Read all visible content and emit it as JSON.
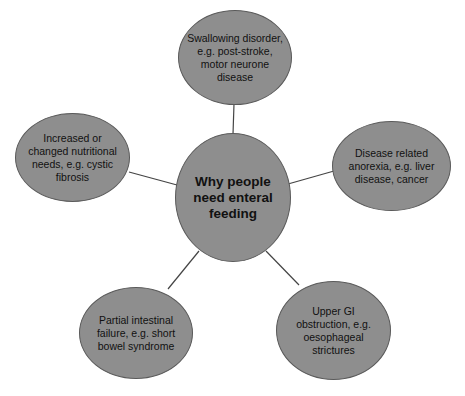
{
  "diagram": {
    "type": "spider/mind-map",
    "colors": {
      "node_fill": "#8e8e8e",
      "node_border": "#5a5a5a",
      "link": "#444444",
      "text": "#111111",
      "background": "#ffffff"
    },
    "center": {
      "label": "Why people need enteral feeding"
    },
    "nodes": [
      {
        "id": "top",
        "label": "Swallowing disorder, e.g. post-stroke, motor neurone disease"
      },
      {
        "id": "right",
        "label": "Disease related anorexia, e.g. liver disease, cancer"
      },
      {
        "id": "bottom-right",
        "label": "Upper GI obstruction, e.g. oesophageal strictures"
      },
      {
        "id": "bottom-left",
        "label": "Partial intestinal failure, e.g. short bowel syndrome"
      },
      {
        "id": "left",
        "label": "Increased or changed nutritional needs, e.g. cystic fibrosis"
      }
    ]
  }
}
